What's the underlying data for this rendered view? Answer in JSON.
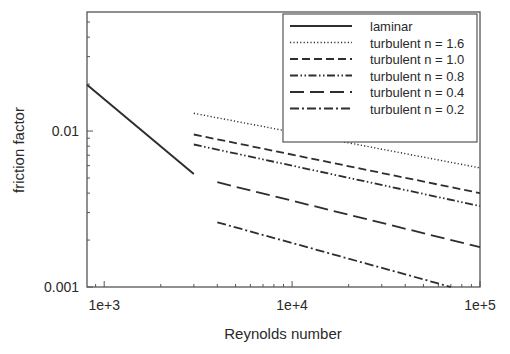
{
  "chart_data": {
    "type": "line",
    "title": "",
    "xlabel": "Reynolds number",
    "ylabel": "friction factor",
    "xscale": "log",
    "yscale": "log",
    "xlim": [
      810,
      100000
    ],
    "ylim": [
      0.001,
      0.058
    ],
    "x_ticks": [
      {
        "value": 1000,
        "label": "1e+3"
      },
      {
        "value": 10000,
        "label": "1e+4"
      },
      {
        "value": 100000,
        "label": "1e+5"
      }
    ],
    "y_ticks": [
      {
        "value": 0.001,
        "label": "0.001"
      },
      {
        "value": 0.01,
        "label": "0.01"
      }
    ],
    "grid": false,
    "legend_position": "upper right",
    "series": [
      {
        "name": "laminar",
        "style": "solid",
        "x": [
          810,
          3000
        ],
        "y": [
          0.0198,
          0.0053
        ]
      },
      {
        "name": "turbulent n = 1.6",
        "style": "dotted",
        "x": [
          3000,
          100000
        ],
        "y": [
          0.013,
          0.0058
        ]
      },
      {
        "name": "turbulent n = 1.0",
        "style": "dashed",
        "x": [
          3000,
          100000
        ],
        "y": [
          0.0095,
          0.004
        ]
      },
      {
        "name": "turbulent n = 0.8",
        "style": "dash-dot-dot",
        "x": [
          3000,
          100000
        ],
        "y": [
          0.0082,
          0.0033
        ]
      },
      {
        "name": "turbulent n = 0.4",
        "style": "long-dash",
        "x": [
          4000,
          100000
        ],
        "y": [
          0.0047,
          0.0018
        ]
      },
      {
        "name": "turbulent n = 0.2",
        "style": "dash-dot",
        "x": [
          4000,
          70000
        ],
        "y": [
          0.0026,
          0.001
        ]
      }
    ]
  }
}
